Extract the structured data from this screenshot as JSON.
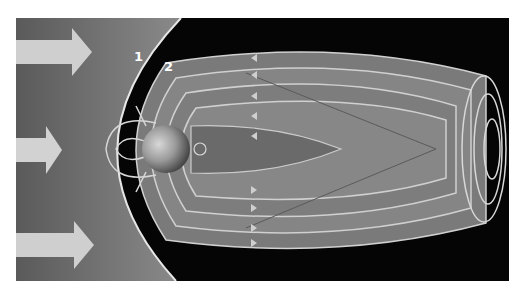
{
  "figure": {
    "labels": [
      {
        "id": "1",
        "text": "1",
        "meaning": "bow-shock"
      },
      {
        "id": "2",
        "text": "2",
        "meaning": "magnetopause"
      }
    ],
    "arrows": [
      {
        "name": "solar-wind-arrow-top",
        "direction": "right"
      },
      {
        "name": "solar-wind-arrow-middle",
        "direction": "right"
      },
      {
        "name": "solar-wind-arrow-bottom",
        "direction": "right"
      }
    ],
    "colors": {
      "background": "#050505",
      "solar_wind": "#6a6a6a",
      "field_tube": "#8a8a8a",
      "field_line": "#cfcfcf",
      "earth": "#9a9a9a"
    }
  }
}
